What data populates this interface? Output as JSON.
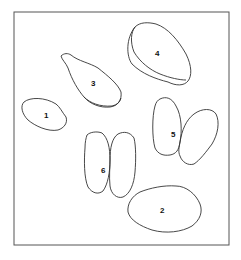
{
  "figure": {
    "frame": {
      "x": 14,
      "y": 12,
      "width": 215,
      "height": 233
    },
    "specimens": [
      {
        "id": "1",
        "label": "1"
      },
      {
        "id": "2",
        "label": "2"
      },
      {
        "id": "3",
        "label": "3"
      },
      {
        "id": "4",
        "label": "4"
      },
      {
        "id": "5",
        "label": "5"
      },
      {
        "id": "6",
        "label": "6"
      }
    ]
  }
}
